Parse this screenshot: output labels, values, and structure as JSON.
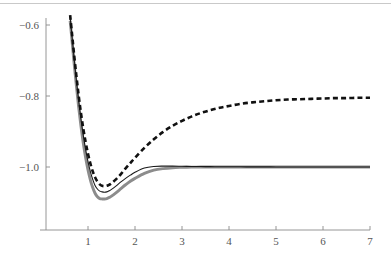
{
  "chart_data": {
    "type": "line",
    "title": "",
    "subtitle": "",
    "xlabel": "",
    "ylabel": "",
    "xlim": [
      0.55,
      7.0
    ],
    "ylim": [
      -1.12,
      -0.55
    ],
    "grid": false,
    "legend": null,
    "xticks": [
      1,
      2,
      3,
      4,
      5,
      6,
      7
    ],
    "xtick_labels": [
      "1",
      "2",
      "3",
      "4",
      "5",
      "6",
      "7"
    ],
    "yticks": [
      -0.6,
      -0.8,
      -1.0
    ],
    "ytick_labels": [
      "-0.6",
      "-0.8",
      "-1.0"
    ],
    "annotations": [],
    "series": [
      {
        "name": "dashed-upper",
        "style": "dashed",
        "color": "#111111",
        "width": 2.6,
        "asymptote": -0.805,
        "minimum": {
          "x": 1.42,
          "y": -1.053
        },
        "x": [
          0.62,
          0.66,
          0.7,
          0.75,
          0.8,
          0.85,
          0.9,
          0.95,
          1.0,
          1.05,
          1.1,
          1.15,
          1.2,
          1.25,
          1.3,
          1.35,
          1.4,
          1.45,
          1.5,
          1.6,
          1.7,
          1.8,
          1.9,
          2.0,
          2.2,
          2.4,
          2.6,
          2.8,
          3.0,
          3.2,
          3.4,
          3.6,
          3.8,
          4.0,
          4.25,
          4.5,
          4.75,
          5.0,
          5.25,
          5.5,
          5.75,
          6.0,
          6.25,
          6.5,
          6.75,
          7.0
        ],
        "y": [
          -0.572,
          -0.625,
          -0.678,
          -0.74,
          -0.797,
          -0.848,
          -0.892,
          -0.93,
          -0.963,
          -0.99,
          -1.012,
          -1.029,
          -1.041,
          -1.049,
          -1.053,
          -1.054,
          -1.053,
          -1.05,
          -1.046,
          -1.034,
          -1.02,
          -1.004,
          -0.989,
          -0.974,
          -0.946,
          -0.922,
          -0.901,
          -0.884,
          -0.87,
          -0.858,
          -0.848,
          -0.84,
          -0.833,
          -0.828,
          -0.822,
          -0.818,
          -0.815,
          -0.812,
          -0.81,
          -0.809,
          -0.808,
          -0.807,
          -0.806,
          -0.806,
          -0.805,
          -0.805
        ]
      },
      {
        "name": "solid-thin-middle",
        "style": "solid",
        "color": "#1a1a1a",
        "width": 1.1,
        "asymptote": -1.0,
        "minimum": {
          "x": 1.4,
          "y": -1.07
        },
        "x": [
          0.62,
          0.66,
          0.7,
          0.75,
          0.8,
          0.85,
          0.9,
          0.95,
          1.0,
          1.05,
          1.1,
          1.15,
          1.2,
          1.25,
          1.3,
          1.35,
          1.4,
          1.45,
          1.5,
          1.6,
          1.7,
          1.8,
          1.9,
          2.0,
          2.2,
          2.4,
          2.6,
          2.8,
          3.0,
          3.2,
          3.4,
          3.6,
          3.8,
          4.0,
          4.25,
          4.5,
          4.75,
          5.0,
          5.25,
          5.5,
          5.75,
          6.0,
          6.25,
          6.5,
          6.75,
          7.0
        ],
        "y": [
          -0.578,
          -0.632,
          -0.688,
          -0.752,
          -0.812,
          -0.865,
          -0.911,
          -0.951,
          -0.985,
          -1.013,
          -1.035,
          -1.052,
          -1.062,
          -1.068,
          -1.07,
          -1.071,
          -1.07,
          -1.067,
          -1.063,
          -1.053,
          -1.042,
          -1.032,
          -1.023,
          -1.015,
          -1.003,
          -0.9985,
          -0.9975,
          -0.9975,
          -0.998,
          -0.9985,
          -0.9988,
          -0.999,
          -0.9992,
          -0.9994,
          -0.9995,
          -0.9996,
          -0.9997,
          -0.9998,
          -0.9998,
          -0.9999,
          -0.9999,
          -0.9999,
          -1.0,
          -1.0,
          -1.0,
          -1.0
        ]
      },
      {
        "name": "solid-gray-lower",
        "style": "solid",
        "color": "#8c8c8c",
        "width": 2.9,
        "asymptote": -1.0,
        "minimum": {
          "x": 1.42,
          "y": -1.09
        },
        "x": [
          0.62,
          0.66,
          0.7,
          0.75,
          0.8,
          0.85,
          0.9,
          0.95,
          1.0,
          1.05,
          1.1,
          1.15,
          1.2,
          1.25,
          1.3,
          1.35,
          1.4,
          1.45,
          1.5,
          1.6,
          1.7,
          1.8,
          1.9,
          2.0,
          2.2,
          2.4,
          2.6,
          2.8,
          3.0,
          3.2,
          3.4,
          3.6,
          3.8,
          4.0,
          4.25,
          4.5,
          4.75,
          5.0,
          5.25,
          5.5,
          5.75,
          6.0,
          6.25,
          6.5,
          6.75,
          7.0
        ],
        "y": [
          -0.588,
          -0.644,
          -0.702,
          -0.768,
          -0.83,
          -0.885,
          -0.933,
          -0.974,
          -1.008,
          -1.036,
          -1.058,
          -1.074,
          -1.084,
          -1.089,
          -1.09,
          -1.09,
          -1.089,
          -1.086,
          -1.082,
          -1.072,
          -1.061,
          -1.05,
          -1.04,
          -1.032,
          -1.018,
          -1.009,
          -1.0045,
          -1.002,
          -1.001,
          -1.0004,
          -1.0001,
          -1.0,
          -0.9999,
          -0.9999,
          -0.9999,
          -0.9999,
          -1.0,
          -1.0,
          -1.0,
          -1.0,
          -1.0,
          -1.0,
          -1.0,
          -1.0,
          -1.0,
          -1.0
        ]
      }
    ]
  },
  "axes": {
    "axis_color": "#8a8a8a",
    "tick_label_color": "#555555"
  },
  "artifacts": {
    "top_scan_line_color": "#c9c9c9"
  }
}
